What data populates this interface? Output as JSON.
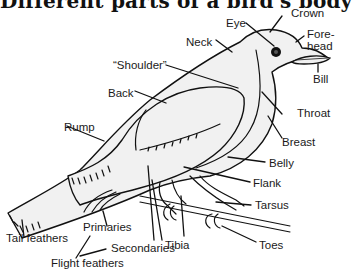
{
  "title": "Different parts of a bird's body",
  "colors": {
    "background": "#ffffff",
    "bird_fill": "#f1f1f1",
    "outline": "#111111",
    "text": "#1a1a1a"
  },
  "labels": {
    "crown": "Crown",
    "eye": "Eye",
    "forehead_1": "Fore-",
    "forehead_2": "head",
    "neck": "Neck",
    "bill": "Bill",
    "shoulder": "“Shoulder”",
    "back": "Back",
    "throat": "Throat",
    "rump": "Rump",
    "breast": "Breast",
    "belly": "Belly",
    "flank": "Flank",
    "tarsus": "Tarsus",
    "tail_feathers": "Tail feathers",
    "primaries": "Primaries",
    "secondaries": "Secondaries",
    "tibia": "Tibia",
    "toes": "Toes",
    "flight_feathers": "Flight feathers"
  }
}
